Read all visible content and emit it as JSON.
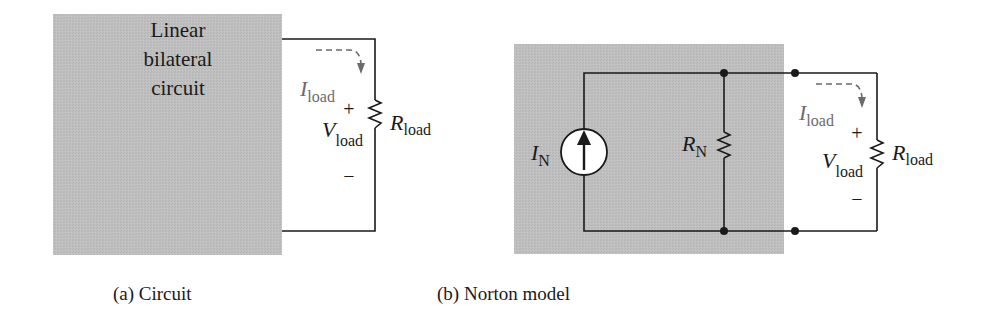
{
  "figure_a": {
    "box_label_lines": [
      "Linear",
      "bilateral",
      "circuit"
    ],
    "current_label": {
      "main": "I",
      "sub": "load"
    },
    "voltage_label": {
      "main": "V",
      "sub": "load"
    },
    "resistor_label": {
      "main": "R",
      "sub": "load"
    },
    "plus": "+",
    "minus": "−",
    "caption": "(a) Circuit"
  },
  "figure_b": {
    "source_label": {
      "main": "I",
      "sub": "N"
    },
    "shunt_resistor_label": {
      "main": "R",
      "sub": "N"
    },
    "current_label": {
      "main": "I",
      "sub": "load"
    },
    "voltage_label": {
      "main": "V",
      "sub": "load"
    },
    "resistor_label": {
      "main": "R",
      "sub": "load"
    },
    "plus": "+",
    "minus": "−",
    "caption": "(b) Norton model"
  },
  "colors": {
    "box_fill": "#bdbdbd",
    "wire": "#1a1a1a",
    "annotation_gray": "#6b6b6b"
  }
}
